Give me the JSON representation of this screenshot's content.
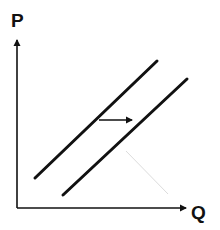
{
  "diagram": {
    "type": "supply_shift",
    "axes": {
      "y_label": "P",
      "x_label": "Q"
    },
    "curves": [
      {
        "name": "original-supply",
        "from": [
          35,
          178
        ],
        "to": [
          157,
          61
        ]
      },
      {
        "name": "shifted-supply",
        "from": [
          63,
          195
        ],
        "to": [
          187,
          79
        ]
      }
    ],
    "shift_arrow": {
      "from": [
        98,
        120
      ],
      "to": [
        133,
        120
      ],
      "direction": "right"
    },
    "colors": {
      "line": "#111111",
      "faint_mark": "#d8d8d8",
      "background": "#ffffff"
    }
  }
}
